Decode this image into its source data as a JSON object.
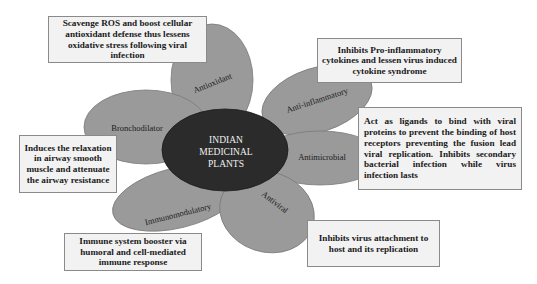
{
  "diagram": {
    "center": {
      "lines": [
        "INDIAN",
        "MEDICINAL",
        "PLANTS"
      ],
      "fill": "#2b2b2b",
      "text_color": "#f0f0f0"
    },
    "petal_fill": "#9a9a9a",
    "petal_stroke": "#7a7a7a",
    "petals": [
      {
        "id": "antioxidant",
        "label": "Antioxidant"
      },
      {
        "id": "anti-inflammatory",
        "label": "Anti-inflammatory"
      },
      {
        "id": "bronchodilator",
        "label": "Bronchodilator"
      },
      {
        "id": "antimicrobial",
        "label": "Antimicrobial"
      },
      {
        "id": "immunomodulatory",
        "label": "Immunomodulatory"
      },
      {
        "id": "antiviral",
        "label": "Antiviral"
      }
    ],
    "boxes": [
      {
        "id": "antioxidant",
        "text": "Scavenge ROS and boost cellular antioxidant defense thus lessens oxidative stress following viral infection"
      },
      {
        "id": "anti-inflammatory",
        "text": "Inhibits Pro-inflammatory cytokines and lessen virus induced cytokine syndrome"
      },
      {
        "id": "antimicrobial",
        "text": "Act as ligands to bind with viral proteins to prevent the binding of host receptors preventing the fusion lead viral replication. Inhibits secondary bacterial infection while virus infection lasts"
      },
      {
        "id": "bronchodilator",
        "text": "Induces the relaxation in airway smooth muscle and attenuate the airway resistance"
      },
      {
        "id": "immunomodulatory",
        "text": "Immune system booster via humoral and cell-mediated immune response"
      },
      {
        "id": "antiviral",
        "text": "Inhibits virus attachment to host and its replication"
      }
    ]
  }
}
